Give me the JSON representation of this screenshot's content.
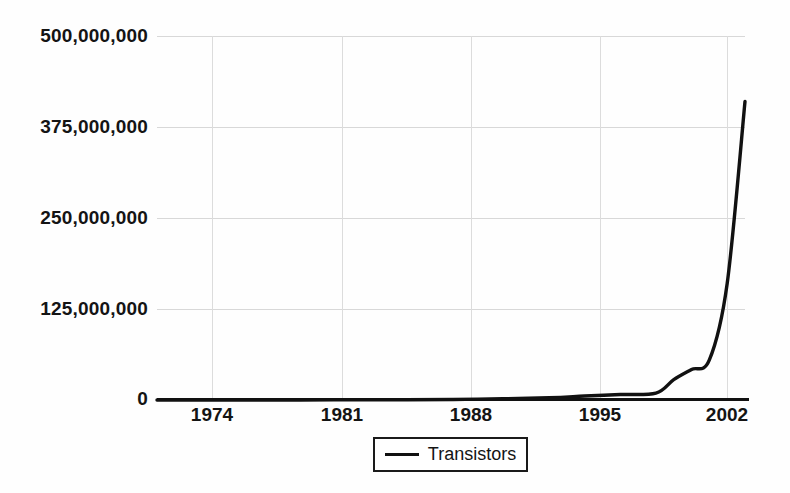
{
  "chart_data": {
    "type": "line",
    "title": "",
    "subtitle": "",
    "xlabel": "",
    "ylabel": "",
    "xlim": [
      1971,
      2004
    ],
    "ylim": [
      0,
      500000000
    ],
    "grid": true,
    "legend_position": "bottom-center",
    "x_ticks": [
      "1974",
      "1981",
      "1988",
      "1995",
      "2002"
    ],
    "x_tick_values": [
      1974,
      1981,
      1988,
      1995,
      2002
    ],
    "y_ticks": [
      "0",
      "125,000,000",
      "250,000,000",
      "375,000,000",
      "500,000,000"
    ],
    "y_tick_values": [
      0,
      125000000,
      250000000,
      375000000,
      500000000
    ],
    "series": [
      {
        "name": "Transistors",
        "color": "#111111",
        "x": [
          1971,
          1972,
          1974,
          1976,
          1978,
          1979,
          1982,
          1985,
          1989,
          1993,
          1995,
          1997,
          1999,
          2000,
          2001,
          2002,
          2003,
          2004
        ],
        "values": [
          2300,
          3500,
          6000,
          8500,
          29000,
          68000,
          134000,
          275000,
          1200000,
          3100000,
          5500000,
          7500000,
          9500000,
          28000000,
          42000000,
          55000000,
          160000000,
          410000000
        ]
      }
    ]
  },
  "legend": {
    "entries": [
      {
        "label": "Transistors",
        "marker": "line-swatch"
      }
    ]
  }
}
